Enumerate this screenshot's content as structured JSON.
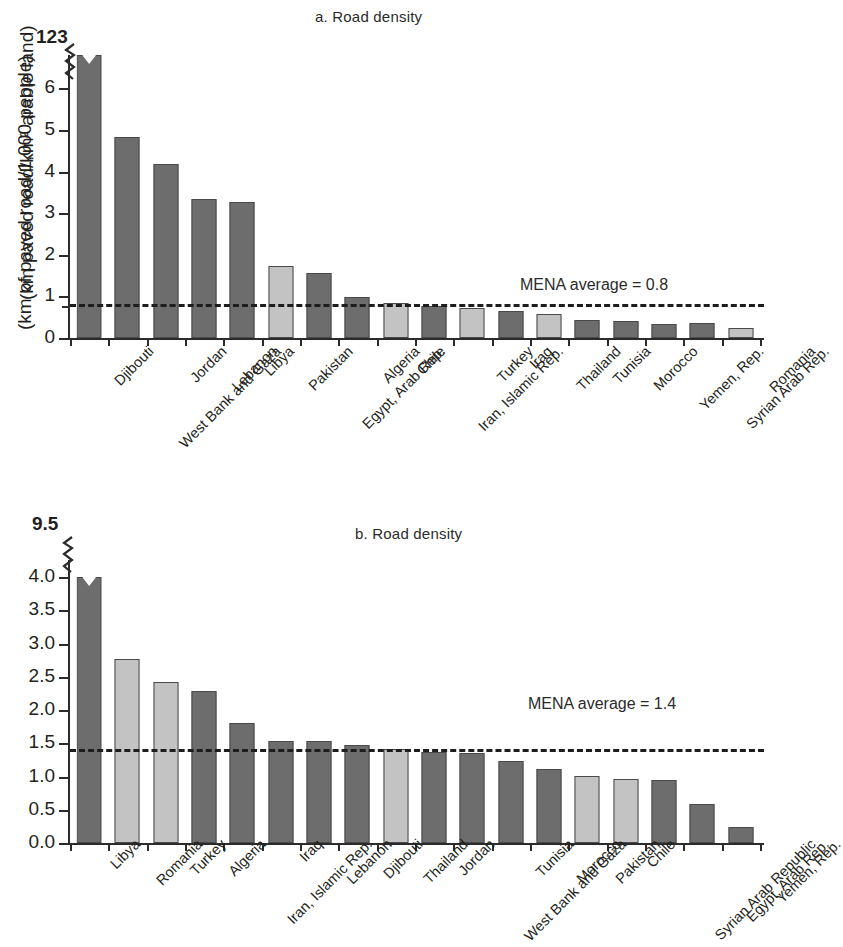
{
  "figure": {
    "panels": [
      {
        "id": "a",
        "title": "a. Road density",
        "ylabel": "(km paved road/km² arable land)",
        "top_axis_value": "123",
        "average_label": "MENA average = 0.8"
      },
      {
        "id": "b",
        "title": "b. Road density",
        "ylabel": "(km of paved road/1,000 people)",
        "top_axis_value": "9.5",
        "average_label": "MENA average = 1.4"
      }
    ]
  },
  "chart_data": [
    {
      "type": "bar",
      "title": "a. Road density",
      "xlabel": "",
      "ylabel": "(km paved road/km² arable land)",
      "ylim": [
        0,
        6.8
      ],
      "axis_break": true,
      "axis_break_top_value": 123,
      "grid": false,
      "legend": "none",
      "yticks": [
        "0",
        "1",
        "2",
        "3",
        "4",
        "5",
        "6"
      ],
      "ytick_values": [
        0,
        1,
        2,
        3,
        4,
        5,
        6
      ],
      "reference_line": {
        "label": "MENA average = 0.8",
        "value": 0.8,
        "style": "dashed"
      },
      "categories": [
        "Djibouti",
        "West Bank and Gaza",
        "Jordan",
        "Lebanon",
        "Libya",
        "Pakistan",
        "Egypt, Arab Rep.",
        "Algeria",
        "Chile",
        "Iran, Islamic Rep.",
        "Turkey",
        "Iraq",
        "Thailand",
        "Tunisia",
        "Morocco",
        "Yemen, Rep.",
        "Syrian Arab Rep.",
        "Romania"
      ],
      "values": [
        123,
        4.83,
        4.18,
        3.34,
        3.27,
        1.73,
        1.57,
        0.99,
        0.83,
        0.77,
        0.73,
        0.65,
        0.57,
        0.44,
        0.4,
        0.34,
        0.35,
        0.23
      ],
      "display_values": [
        6.8,
        4.83,
        4.18,
        3.34,
        3.27,
        1.73,
        1.57,
        0.99,
        0.83,
        0.77,
        0.73,
        0.65,
        0.57,
        0.44,
        0.4,
        0.34,
        0.35,
        0.23
      ],
      "bar_colors": [
        "dark",
        "dark",
        "dark",
        "dark",
        "dark",
        "light",
        "dark",
        "dark",
        "light",
        "dark",
        "light",
        "dark",
        "light",
        "dark",
        "dark",
        "dark",
        "dark",
        "light"
      ],
      "truncated_bars": [
        0
      ]
    },
    {
      "type": "bar",
      "title": "b. Road density",
      "xlabel": "",
      "ylabel": "(km of paved road/1,000 people)",
      "ylim": [
        0,
        4.0
      ],
      "axis_break": true,
      "axis_break_top_value": 9.5,
      "grid": false,
      "legend": "none",
      "yticks": [
        "0.0",
        "0.5",
        "1.0",
        "1.5",
        "2.0",
        "2.5",
        "3.0",
        "3.5",
        "4.0"
      ],
      "ytick_values": [
        0,
        0.5,
        1.0,
        1.5,
        2.0,
        2.5,
        3.0,
        3.5,
        4.0
      ],
      "reference_line": {
        "label": "MENA average = 1.4",
        "value": 1.4,
        "style": "dashed"
      },
      "categories": [
        "Libya",
        "Romania",
        "Turkey",
        "Algeria",
        "Iran, Islamic Rep.",
        "Iraq",
        "Lebanon",
        "Djibouti",
        "Thailand",
        "Jordan",
        "West Bank and Gaza",
        "Tunisia",
        "Morocco",
        "Pakistan",
        "Chile",
        "Syrian Arab Republic",
        "Egypt, Arab Rep.",
        "Yemen, Rep."
      ],
      "values": [
        9.5,
        2.77,
        2.42,
        2.28,
        1.8,
        1.54,
        1.54,
        1.48,
        1.41,
        1.37,
        1.35,
        1.23,
        1.12,
        1.01,
        0.96,
        0.95,
        0.58,
        0.24
      ],
      "display_values": [
        4.0,
        2.77,
        2.42,
        2.28,
        1.8,
        1.54,
        1.54,
        1.48,
        1.41,
        1.37,
        1.35,
        1.23,
        1.12,
        1.01,
        0.96,
        0.95,
        0.58,
        0.24
      ],
      "bar_colors": [
        "dark",
        "light",
        "light",
        "dark",
        "dark",
        "dark",
        "dark",
        "dark",
        "light",
        "dark",
        "dark",
        "dark",
        "dark",
        "light",
        "light",
        "dark",
        "dark",
        "dark"
      ],
      "truncated_bars": [
        0
      ]
    }
  ],
  "colors": {
    "bar_dark": "#6d6d6d",
    "bar_light": "#c3c3c3",
    "axis": "#2b2b2b",
    "text": "#231f20",
    "background": "#ffffff"
  }
}
